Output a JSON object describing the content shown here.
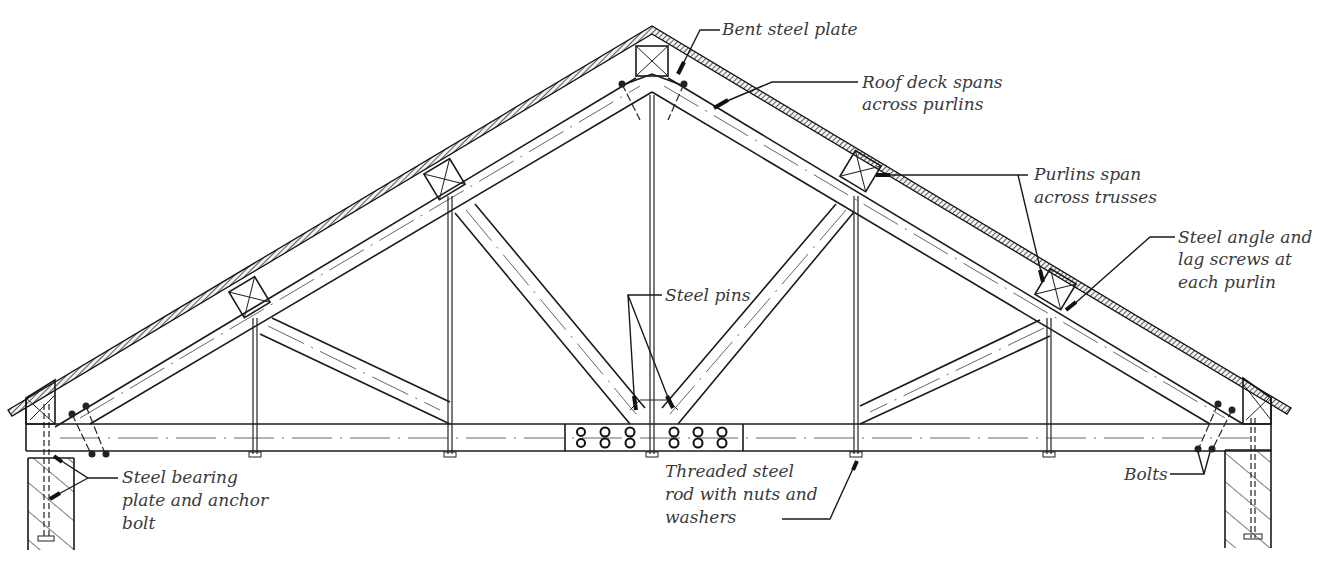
{
  "diagram": {
    "type": "roof-truss-elevation",
    "line_color": "#1a1a1a",
    "label_color": "#3a3a3a",
    "background": "#ffffff"
  },
  "labels": {
    "bent_steel_plate": "Bent steel plate",
    "roof_deck": [
      "Roof deck spans",
      "across purlins"
    ],
    "purlins": [
      "Purlins span",
      "across trusses"
    ],
    "steel_angle": [
      "Steel angle and",
      "lag screws at",
      "each purlin"
    ],
    "steel_pins": "Steel pins",
    "bearing_plate": [
      "Steel bearing",
      "plate and anchor",
      "bolt"
    ],
    "threaded_rod": [
      "Threaded steel",
      "rod with nuts and",
      "washers"
    ],
    "bolts": "Bolts"
  },
  "components": [
    {
      "name": "roof-deck",
      "icon": "hatched-band"
    },
    {
      "name": "purlin",
      "count": 6,
      "icon": "crossed-box"
    },
    {
      "name": "top-chord",
      "count": 2
    },
    {
      "name": "bottom-chord",
      "count": 1
    },
    {
      "name": "diagonal-web",
      "count": 4
    },
    {
      "name": "vertical-rod",
      "count": 5
    },
    {
      "name": "splice-plate",
      "bolt_holes": 12
    },
    {
      "name": "bearing-wall",
      "count": 2,
      "icon": "hatched-rect"
    }
  ]
}
